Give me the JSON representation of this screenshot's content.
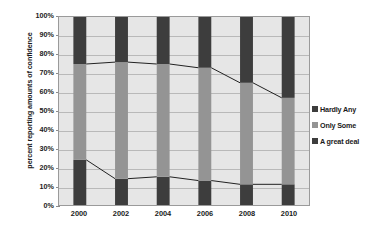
{
  "chart_data": {
    "type": "bar",
    "subtype": "100% stacked bar with connector lines",
    "title": "",
    "xlabel": "",
    "ylabel": "percent reporting amounts of confidence",
    "categories": [
      "2000",
      "2002",
      "2004",
      "2006",
      "2008",
      "2010"
    ],
    "ylim": [
      0,
      100
    ],
    "ytick_labels": [
      "0%",
      "10%",
      "20%",
      "30%",
      "40%",
      "50%",
      "60%",
      "70%",
      "80%",
      "90%",
      "100%"
    ],
    "ytick_values": [
      0,
      10,
      20,
      30,
      40,
      50,
      60,
      70,
      80,
      90,
      100
    ],
    "grid": true,
    "legend_position": "right",
    "series": [
      {
        "name": "A great deal",
        "color": "#3d3d3d",
        "values": [
          24,
          14,
          15,
          13,
          11,
          11
        ]
      },
      {
        "name": "Only Some",
        "color": "#949494",
        "values": [
          51,
          62,
          60,
          60,
          54,
          46
        ]
      },
      {
        "name": "Hardly Any",
        "color": "#3d3d3d",
        "values": [
          25,
          24,
          25,
          27,
          35,
          43
        ]
      }
    ],
    "cumulative_boundaries": {
      "great_deal_top": [
        24,
        14,
        15,
        13,
        11,
        11
      ],
      "only_some_top": [
        75,
        76,
        75,
        73,
        65,
        57
      ]
    },
    "plot_background": "#e6e6e6",
    "gridline_color": "#b9b9b9",
    "connector_line_color": "#1f1f1f"
  },
  "legend": {
    "items": [
      {
        "label": "Hardly Any",
        "color": "#3d3d3d"
      },
      {
        "label": "Only Some",
        "color": "#949494"
      },
      {
        "label": "A great deal",
        "color": "#3d3d3d"
      }
    ]
  }
}
